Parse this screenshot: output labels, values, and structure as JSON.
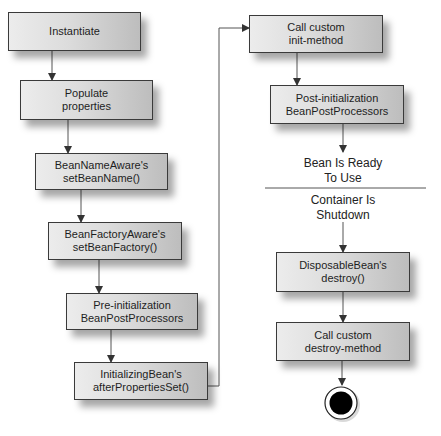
{
  "diagram": {
    "type": "flowchart",
    "nodes": [
      {
        "id": "instantiate",
        "label": "Instantiate"
      },
      {
        "id": "populate",
        "label": "Populate\nproperties"
      },
      {
        "id": "bean-name-aware",
        "label": "BeanNameAware's\nsetBeanName()"
      },
      {
        "id": "bean-factory-aware",
        "label": "BeanFactoryAware's\nsetBeanFactory()"
      },
      {
        "id": "pre-init",
        "label": "Pre-initialization\nBeanPostProcessors"
      },
      {
        "id": "initializing-bean",
        "label": "InitializingBean's\nafterPropertiesSet()"
      },
      {
        "id": "custom-init",
        "label": "Call custom\ninit-method"
      },
      {
        "id": "post-init",
        "label": "Post-initialization\nBeanPostProcessors"
      },
      {
        "id": "disposable-bean",
        "label": "DisposableBean's\ndestroy()"
      },
      {
        "id": "custom-destroy",
        "label": "Call custom\ndestroy-method"
      }
    ],
    "states": {
      "ready": "Bean Is Ready\nTo Use",
      "shutdown": "Container Is\nShutdown"
    },
    "edges": [
      [
        "instantiate",
        "populate"
      ],
      [
        "populate",
        "bean-name-aware"
      ],
      [
        "bean-name-aware",
        "bean-factory-aware"
      ],
      [
        "bean-factory-aware",
        "pre-init"
      ],
      [
        "pre-init",
        "initializing-bean"
      ],
      [
        "initializing-bean",
        "custom-init"
      ],
      [
        "custom-init",
        "post-init"
      ],
      [
        "post-init",
        "ready"
      ],
      [
        "shutdown",
        "disposable-bean"
      ],
      [
        "disposable-bean",
        "custom-destroy"
      ],
      [
        "custom-destroy",
        "end"
      ]
    ],
    "colors": {
      "box_border": "#3a3a3a",
      "box_fill_light": "#ececec",
      "box_fill_dark": "#bdbdbd",
      "line": "#444444",
      "end_fill": "#000000"
    }
  }
}
